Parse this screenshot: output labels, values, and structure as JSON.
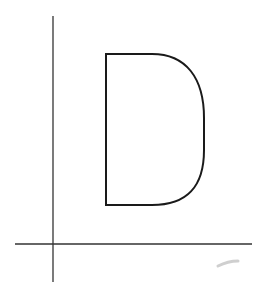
{
  "diagram": {
    "background": "#ffffff",
    "stroke_color": "#1a1a1a",
    "axes": {
      "vertical": {
        "x": 53,
        "y1": 16,
        "y2": 282
      },
      "horizontal": {
        "y": 91,
        "x1": 15,
        "x2": 252
      }
    },
    "letter": "D",
    "smudge_color": "#cfcfcf"
  }
}
